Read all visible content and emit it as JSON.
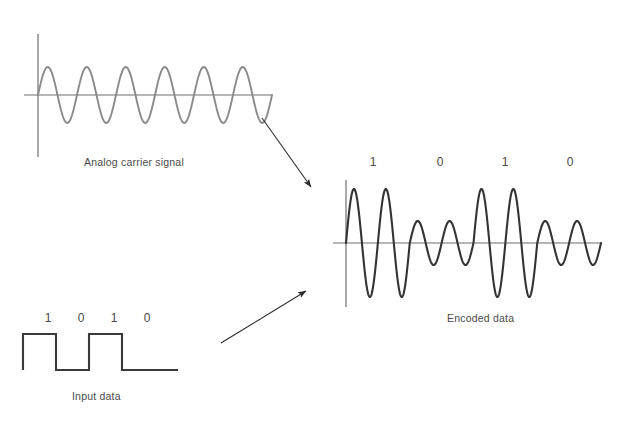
{
  "diagram": {
    "colors": {
      "carrier_stroke": "#8a8a8a",
      "encoded_stroke": "#333333",
      "input_stroke": "#3a3a3a",
      "axis": "#6f6f6f",
      "arrow": "#2b2b2b",
      "text": "#4a4a4a",
      "background": "#ffffff"
    }
  },
  "panels": {
    "carrier": {
      "caption": "Analog carrier signal",
      "signal_type": "sine",
      "cycles": 6,
      "amplitude": 28,
      "axis_y": 95,
      "axis_x": 38,
      "x_start": 38,
      "x_end": 272
    },
    "input": {
      "caption": "Input data",
      "signal_type": "square",
      "bits": [
        "1",
        "0",
        "1",
        "0"
      ],
      "bit_labels": [
        {
          "text": "1",
          "x": 48
        },
        {
          "text": "0",
          "x": 81
        },
        {
          "text": "1",
          "x": 114
        },
        {
          "text": "0",
          "x": 147
        }
      ],
      "baseline_y": 370,
      "high_y": 334,
      "x_start": 23,
      "bit_width": 33,
      "tail_end": 178
    },
    "encoded": {
      "caption": "Encoded data",
      "signal_type": "ask-modulated-sine",
      "bits": [
        "1",
        "0",
        "1",
        "0"
      ],
      "bit_labels": [
        {
          "text": "1",
          "x": 373
        },
        {
          "text": "0",
          "x": 440
        },
        {
          "text": "1",
          "x": 505
        },
        {
          "text": "0",
          "x": 570
        }
      ],
      "axis_y": 243,
      "axis_x": 346,
      "x_start": 346,
      "x_end": 601,
      "cycles_per_bit": 2,
      "amplitude_high": 54,
      "amplitude_low": 22
    }
  },
  "arrows": [
    {
      "name": "carrier-to-encoded",
      "x1": 262,
      "y1": 118,
      "x2": 311,
      "y2": 187
    },
    {
      "name": "input-to-encoded",
      "x1": 221,
      "y1": 343,
      "x2": 306,
      "y2": 291
    }
  ]
}
